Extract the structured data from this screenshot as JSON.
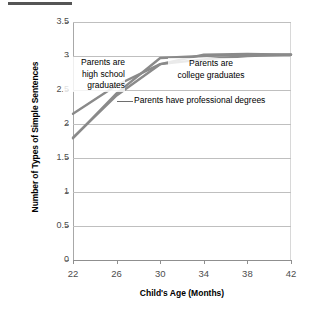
{
  "figure": {
    "top_rule_name": "title-underline-rule"
  },
  "chart_data": {
    "type": "line",
    "title": "",
    "xlabel": "Child's Age (Months)",
    "ylabel": "Number of Types of Simple Sentences",
    "x": [
      22,
      26,
      30,
      34,
      38,
      42
    ],
    "xlim": [
      22,
      42
    ],
    "ylim": [
      0,
      3.5
    ],
    "ytick_labels": [
      "3.5",
      "3",
      "2.5",
      "2",
      "1.5",
      "1",
      "0.5",
      "0"
    ],
    "ytick_values": [
      3.5,
      3,
      2.5,
      2,
      1.5,
      1,
      0.5,
      0
    ],
    "xtick_labels": [
      "22",
      "26",
      "30",
      "34",
      "38",
      "42"
    ],
    "grid": true,
    "legend_position": "inline-annotations",
    "line_color": "#8a8a8a",
    "series": [
      {
        "name": "Parents are high school graduates",
        "values": [
          2.15,
          2.57,
          2.88,
          2.95,
          3.0,
          3.02
        ]
      },
      {
        "name": "Parents are college graduates",
        "values": [
          1.79,
          2.45,
          2.97,
          3.0,
          3.02,
          3.02
        ]
      },
      {
        "name": "Parents have professional degrees",
        "values": [
          1.8,
          2.42,
          2.88,
          3.02,
          3.03,
          3.02
        ]
      }
    ],
    "annotations": [
      {
        "id": "high-school",
        "lines": [
          "Parents are",
          "high school",
          "graduates"
        ],
        "text": "Parents are high school graduates"
      },
      {
        "id": "college",
        "lines": [
          "Parents are",
          "college graduates"
        ],
        "text": "Parents are college graduates"
      },
      {
        "id": "professional",
        "lines": [
          "Parents have professional degrees"
        ],
        "text": "Parents have professional degrees"
      }
    ]
  }
}
